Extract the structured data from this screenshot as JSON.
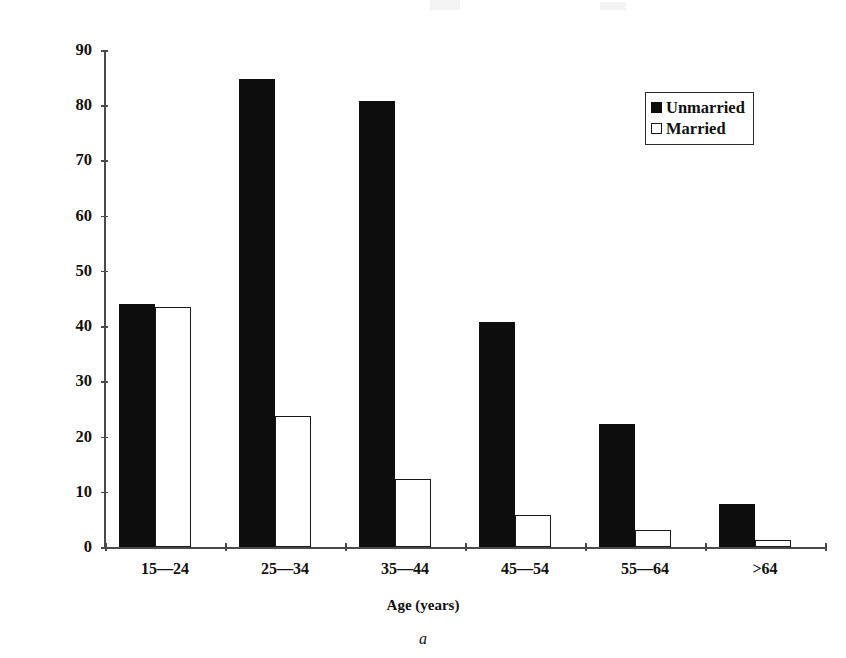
{
  "chart_data": {
    "type": "bar",
    "title": "",
    "xlabel": "Age (years)",
    "ylabel": "Homicides per million per annum",
    "categories": [
      "15—24",
      "25—34",
      "35—44",
      "45—54",
      "55—64",
      ">64"
    ],
    "series": [
      {
        "name": "Unmarried",
        "color": "#0d0d0d",
        "values": [
          44.0,
          84.8,
          80.7,
          40.7,
          22.3,
          7.8
        ]
      },
      {
        "name": "Married",
        "color": "#ffffff",
        "values": [
          43.5,
          23.8,
          12.4,
          5.8,
          3.0,
          1.2
        ]
      }
    ],
    "ylim": [
      0,
      90
    ],
    "yticks": [
      0,
      10,
      20,
      30,
      40,
      50,
      60,
      70,
      80,
      90
    ],
    "ytick_labels": [
      "0",
      "10",
      "20",
      "30",
      "40",
      "50",
      "60",
      "70",
      "80",
      "90"
    ],
    "grid": false,
    "legend_position": "top-right"
  },
  "legend": {
    "entries": [
      {
        "label": "Unmarried",
        "swatch": "filled-square-icon"
      },
      {
        "label": "Married",
        "swatch": "hollow-square-icon"
      }
    ]
  },
  "caption": {
    "label": "a"
  }
}
